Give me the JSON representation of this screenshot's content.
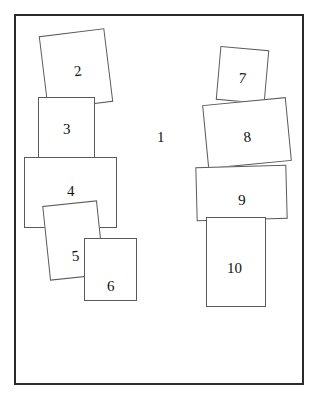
{
  "diagram": {
    "background_color": "#ffffff",
    "frame": {
      "label": "1",
      "border_color": "#2b2b2b",
      "border_width_px": 2,
      "x": 14,
      "y": 14,
      "width": 290,
      "height": 371,
      "label_x": 157,
      "label_y": 130
    },
    "rect_border_color": "#5a5a5a",
    "rect_fill_color": "#ffffff",
    "label_color": "#111111",
    "regions": [
      {
        "id": "r2",
        "label": "2",
        "x": 43,
        "y": 32,
        "width": 66,
        "height": 74,
        "rotation": -7,
        "label_x": 30,
        "label_y": 31,
        "group": "left"
      },
      {
        "id": "r3",
        "label": "3",
        "x": 38,
        "y": 97,
        "width": 57,
        "height": 61,
        "rotation": 0,
        "label_x": 24,
        "label_y": 24,
        "group": "left"
      },
      {
        "id": "r4",
        "label": "4",
        "x": 24,
        "y": 157,
        "width": 93,
        "height": 71,
        "rotation": 0,
        "label_x": 42,
        "label_y": 26,
        "group": "left"
      },
      {
        "id": "r5",
        "label": "5",
        "x": 46,
        "y": 203,
        "width": 55,
        "height": 75,
        "rotation": -6,
        "label_x": 23,
        "label_y": 45,
        "group": "left"
      },
      {
        "id": "r6",
        "label": "6",
        "x": 84,
        "y": 238,
        "width": 53,
        "height": 63,
        "rotation": 0,
        "label_x": 22,
        "label_y": 40,
        "group": "left"
      },
      {
        "id": "r7",
        "label": "7",
        "x": 218,
        "y": 48,
        "width": 49,
        "height": 54,
        "rotation": 5,
        "label_x": 20,
        "label_y": 22,
        "group": "right"
      },
      {
        "id": "r8",
        "label": "8",
        "x": 205,
        "y": 101,
        "width": 84,
        "height": 64,
        "rotation": -5.5,
        "label_x": 37,
        "label_y": 28,
        "group": "right"
      },
      {
        "id": "r9",
        "label": "9",
        "x": 196,
        "y": 166,
        "width": 91,
        "height": 54,
        "rotation": -1.5,
        "label_x": 41,
        "label_y": 26,
        "group": "right"
      },
      {
        "id": "r10",
        "label": "10",
        "x": 206,
        "y": 217,
        "width": 60,
        "height": 90,
        "rotation": 0,
        "label_x": 20,
        "label_y": 43,
        "group": "right"
      }
    ]
  }
}
